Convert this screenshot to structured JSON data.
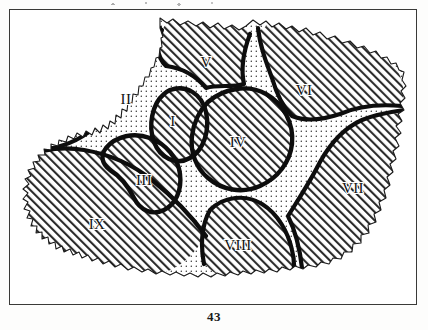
{
  "figure": {
    "kind": "map",
    "caption_number": "43",
    "frame": {
      "visible": true,
      "color": "#3a3a38"
    },
    "background_color": "#ffffff",
    "ink_color": "#111111"
  },
  "legend_note": {
    "fill_hatched": "diagonal hatching",
    "fill_stippled": "dotted / stippled"
  },
  "regions": [
    {
      "id": "I",
      "label": "I",
      "fill": "hatched",
      "label_x": 163,
      "label_y": 113
    },
    {
      "id": "II",
      "label": "II",
      "fill": "hatched",
      "label_x": 116,
      "label_y": 91
    },
    {
      "id": "III",
      "label": "III",
      "fill": "hatched",
      "label_x": 134,
      "label_y": 172
    },
    {
      "id": "IV",
      "label": "IV",
      "fill": "hatched",
      "label_x": 228,
      "label_y": 134
    },
    {
      "id": "V",
      "label": "V",
      "fill": "hatched",
      "label_x": 196,
      "label_y": 54
    },
    {
      "id": "VI",
      "label": "VI",
      "fill": "hatched",
      "label_x": 294,
      "label_y": 82
    },
    {
      "id": "VII",
      "label": "VII",
      "fill": "hatched",
      "label_x": 343,
      "label_y": 180
    },
    {
      "id": "VIII",
      "label": "VIII",
      "fill": "hatched",
      "label_x": 228,
      "label_y": 237
    },
    {
      "id": "IX",
      "label": "IX",
      "fill": "hatched",
      "label_x": 87,
      "label_y": 216
    }
  ],
  "page_footer": {
    "page_number": "43"
  }
}
